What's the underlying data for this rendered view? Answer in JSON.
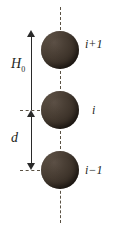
{
  "figure": {
    "name": "chain-of-spheres-diagram",
    "background_color": "#ffffff",
    "axis_color": "#5a5244",
    "sphere_color": "#3b3128",
    "arrow_color": "#2a2a2a",
    "text_color": "#231f1c"
  },
  "dimensions": {
    "height_label": "H",
    "height_subscript": "0",
    "spacing_label": "d"
  },
  "spheres": [
    {
      "index_label": "i+1",
      "base": "i",
      "operator": "+",
      "offset": "1"
    },
    {
      "index_label": "i",
      "base": "i",
      "operator": "",
      "offset": ""
    },
    {
      "index_label": "i−1",
      "base": "i",
      "operator": "−",
      "offset": "1"
    }
  ],
  "labels": {
    "top": "i+1",
    "middle": "i",
    "bottom": "i−1"
  }
}
